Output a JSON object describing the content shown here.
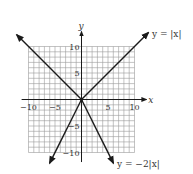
{
  "chart_data": {
    "type": "line",
    "title": "",
    "xlabel": "x",
    "ylabel": "y",
    "xlim": [
      -10,
      10
    ],
    "ylim": [
      -10,
      10
    ],
    "grid": true,
    "grid_step": 1,
    "x_ticks": [
      {
        "value": -10,
        "label": "−10"
      },
      {
        "value": -5,
        "label": "−5"
      },
      {
        "value": 5,
        "label": "5"
      },
      {
        "value": 10,
        "label": "10"
      }
    ],
    "y_ticks": [
      {
        "value": 10,
        "label": "10"
      },
      {
        "value": 5,
        "label": "5"
      },
      {
        "value": -5,
        "label": "−5"
      },
      {
        "value": -10,
        "label": "−10"
      }
    ],
    "series": [
      {
        "name": "y = |x|",
        "label": "y = |x|",
        "points": [
          [
            -12.2,
            12.2
          ],
          [
            0,
            0
          ],
          [
            12.6,
            12.6
          ]
        ]
      },
      {
        "name": "y = −2|x|",
        "label": "y = −2|x|",
        "points": [
          [
            -6,
            -12
          ],
          [
            0,
            0
          ],
          [
            6,
            -12
          ]
        ]
      }
    ],
    "line_color": "#1a1a1a",
    "grid_color": "#9a9a9a"
  }
}
